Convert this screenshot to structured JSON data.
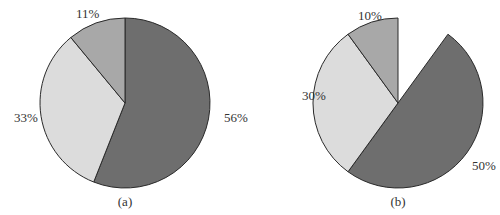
{
  "chart_data": [
    {
      "type": "pie",
      "caption": "(a)",
      "start": "top",
      "direction": "clockwise",
      "gap_before_percent": 0,
      "slices": [
        {
          "label": "56%",
          "value": 56,
          "color": "#6e6e6e"
        },
        {
          "label": "33%",
          "value": 33,
          "color": "#dcdcdc"
        },
        {
          "label": "11%",
          "value": 11,
          "color": "#a8a8a8"
        }
      ]
    },
    {
      "type": "pie",
      "caption": "(b)",
      "start": "top",
      "direction": "clockwise",
      "gap_before_percent": 10,
      "slices": [
        {
          "label": "50%",
          "value": 50,
          "color": "#6e6e6e"
        },
        {
          "label": "30%",
          "value": 30,
          "color": "#dcdcdc"
        },
        {
          "label": "10%",
          "value": 10,
          "color": "#a8a8a8"
        }
      ]
    }
  ]
}
